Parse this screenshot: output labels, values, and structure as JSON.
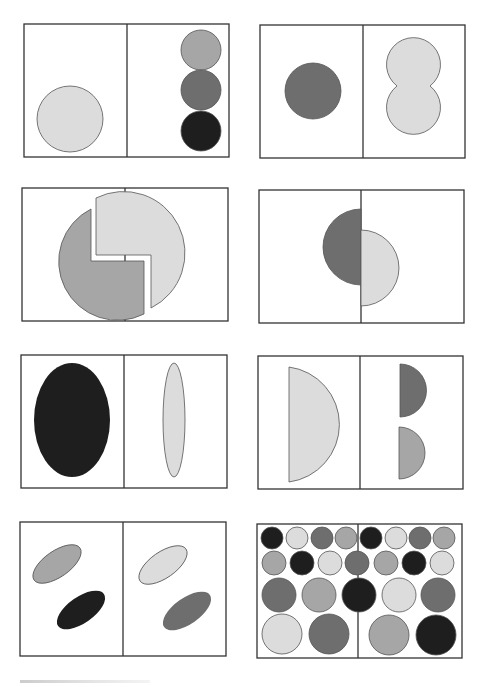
{
  "figure": {
    "type": "panel-grid",
    "rows": 4,
    "columns": 2,
    "colors": {
      "light": "#dcdcdc",
      "mid": "#a6a6a6",
      "darkmid": "#6e6e6e",
      "dark": "#1e1e1e",
      "frame": "#333333"
    },
    "panels": [
      {
        "id": "p1",
        "left": "one large light circle",
        "right": "three stacked circles: mid, darkmid, dark"
      },
      {
        "id": "p2",
        "left": "one darkmid circle",
        "right": "two overlapping light circles (figure-eight)"
      },
      {
        "id": "p3",
        "left": "mid notched circle half",
        "right": "light notched circle half",
        "note": "interlocking shapes crossing the divider"
      },
      {
        "id": "p4",
        "left": "darkmid left semicircle",
        "right": "light right semicircle offset lower"
      },
      {
        "id": "p5",
        "left": "large dark ellipse",
        "right": "thin light vertical ellipse"
      },
      {
        "id": "p6",
        "left": "large light half-disc",
        "right": "two small half-discs: darkmid and mid"
      },
      {
        "id": "p7",
        "left": "tilted mid ellipse and dark ellipse",
        "right": "tilted light ellipse and darkmid ellipse"
      },
      {
        "id": "p8",
        "left": "grid of circles of four shades",
        "right": "grid of circles of four shades"
      }
    ]
  },
  "footer": {
    "text": ""
  }
}
